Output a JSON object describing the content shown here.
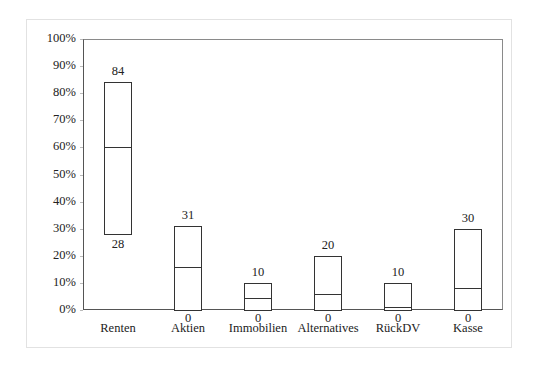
{
  "chart_data": {
    "type": "bar",
    "subtype": "floating-range-bars",
    "title": "",
    "xlabel": "",
    "ylabel": "",
    "ylim": [
      0,
      100
    ],
    "y_ticks": [
      "0%",
      "10%",
      "20%",
      "30%",
      "40%",
      "50%",
      "60%",
      "70%",
      "80%",
      "90%",
      "100%"
    ],
    "grid": false,
    "legend": null,
    "categories": [
      "Renten",
      "Aktien",
      "Immobilien",
      "Alternatives",
      "RückDV",
      "Kasse"
    ],
    "series": [
      {
        "name": "max",
        "values": [
          84,
          31,
          10,
          20,
          10,
          30
        ]
      },
      {
        "name": "min",
        "values": [
          28,
          0,
          0,
          0,
          0,
          0
        ]
      },
      {
        "name": "current",
        "values": [
          60,
          16,
          4.5,
          6,
          1,
          8
        ]
      }
    ],
    "bars": [
      {
        "category": "Renten",
        "max": 84,
        "min": 28,
        "current": 60,
        "max_label": "84",
        "min_label": "28"
      },
      {
        "category": "Aktien",
        "max": 31,
        "min": 0,
        "current": 16,
        "max_label": "31",
        "min_label": "0"
      },
      {
        "category": "Immobilien",
        "max": 10,
        "min": 0,
        "current": 4.5,
        "max_label": "10",
        "min_label": "0"
      },
      {
        "category": "Alternatives",
        "max": 20,
        "min": 0,
        "current": 6,
        "max_label": "20",
        "min_label": "0"
      },
      {
        "category": "RückDV",
        "max": 10,
        "min": 0,
        "current": 1,
        "max_label": "10",
        "min_label": "0"
      },
      {
        "category": "Kasse",
        "max": 30,
        "min": 0,
        "current": 8,
        "max_label": "30",
        "min_label": "0"
      }
    ]
  }
}
